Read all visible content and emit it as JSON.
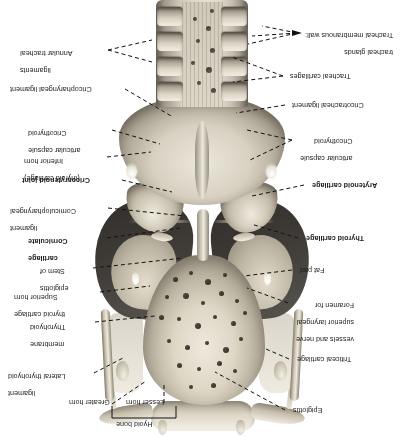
{
  "figure": {
    "orientation": "inverted",
    "view": "posterior view of larynx, hyoid bone and upper trachea",
    "ink_color": "#1a1a1a",
    "background": "#ffffff"
  },
  "labels": {
    "right_column": [
      {
        "id": "tracheal-membranous-wall",
        "lines": [
          "Tracheal membranous wall:",
          "tracheal glands"
        ],
        "bold": false,
        "arrow": true
      },
      {
        "id": "tracheal-cartilages",
        "lines": [
          "Tracheal cartilages"
        ],
        "bold": false,
        "arrow": false
      },
      {
        "id": "cricotracheal-ligament",
        "lines": [
          "Cricotracheal ligament"
        ],
        "bold": false,
        "arrow": false
      },
      {
        "id": "cricothyroid-articular-capsule-right",
        "lines": [
          "Cricothyroid",
          "articular capsule"
        ],
        "bold": false,
        "arrow": false
      },
      {
        "id": "arytenoid-cartilage",
        "lines": [
          "Arytenoid cartilage"
        ],
        "bold": true,
        "arrow": false
      },
      {
        "id": "thyroid-cartilage",
        "lines": [
          "Thyroid cartilage"
        ],
        "bold": true,
        "arrow": false
      },
      {
        "id": "fat-pad",
        "lines": [
          "Fat pad"
        ],
        "bold": false,
        "arrow": false
      },
      {
        "id": "foramen-superior-laryngeal",
        "lines": [
          "Foramen for",
          "superior laryngeal",
          "vessels and nerve"
        ],
        "bold": false,
        "arrow": false
      },
      {
        "id": "triticeal-cartilage",
        "lines": [
          "Triticeal cartilage"
        ],
        "bold": false,
        "arrow": false
      },
      {
        "id": "epiglottis",
        "lines": [
          "Epiglottis"
        ],
        "bold": false,
        "arrow": false
      }
    ],
    "left_column": [
      {
        "id": "annular-tracheal-ligaments",
        "lines": [
          "Annular tracheal",
          "ligaments"
        ],
        "bold": false
      },
      {
        "id": "cricopharyngeal-ligament",
        "lines": [
          "Cricopharyngeal ligament"
        ],
        "bold": false
      },
      {
        "id": "cricothyroid-articular-capsule-left",
        "lines": [
          "Cricothyroid",
          "articular capsule"
        ],
        "bold": false
      },
      {
        "id": "inferior-horn-thyroid",
        "lines": [
          "Inferior horn",
          "(thyroid cartilage)"
        ],
        "bold": false
      },
      {
        "id": "cricoarytenoid-joint",
        "lines": [
          "Cricoarytenoid joint"
        ],
        "bold": true
      },
      {
        "id": "corniculopharyngeal-ligament",
        "lines": [
          "Corniculopharyngeal",
          "ligament"
        ],
        "bold": false
      },
      {
        "id": "corniculate-cartilage",
        "lines": [
          "Corniculate",
          "cartilage"
        ],
        "bold": true
      },
      {
        "id": "stem-of-epiglottis",
        "lines": [
          "Stem of",
          "epiglottis"
        ],
        "bold": false
      },
      {
        "id": "superior-horn-thyroid",
        "lines": [
          "Superior horn",
          "thyroid cartilage"
        ],
        "bold": false
      },
      {
        "id": "thyrohyoid-membrane",
        "lines": [
          "Thyrohyoid",
          "membrane"
        ],
        "bold": false
      },
      {
        "id": "lateral-thyrohyoid-ligament",
        "lines": [
          "Lateral thyrohyoid",
          "ligament"
        ],
        "bold": false
      }
    ],
    "bottom_group": {
      "id": "hyoid-bone-group",
      "bracket_label": "Hyoid bone",
      "members": [
        {
          "id": "greater-horn",
          "lines": [
            "Greater horn"
          ]
        },
        {
          "id": "lesser-horn",
          "lines": [
            "Lesser horn"
          ]
        }
      ]
    }
  },
  "structures": [
    {
      "id": "trachea",
      "name": "Trachea"
    },
    {
      "id": "tracheal-rings",
      "name": "Tracheal cartilage rings",
      "count": 4
    },
    {
      "id": "membranous-wall",
      "name": "Tracheal membranous wall"
    },
    {
      "id": "tracheal-glands",
      "name": "Tracheal glands",
      "count": 9
    },
    {
      "id": "cricoid-lamina",
      "name": "Cricoid cartilage lamina"
    },
    {
      "id": "arytenoid-cartilages",
      "name": "Arytenoid cartilages",
      "count": 2
    },
    {
      "id": "thyroid-laminae",
      "name": "Thyroid cartilage laminae",
      "count": 2
    },
    {
      "id": "fat-pads",
      "name": "Fat pads",
      "count": 2
    },
    {
      "id": "epiglottis-leaf",
      "name": "Epiglottis"
    },
    {
      "id": "epiglottic-foveolae",
      "name": "Epiglottic foveolae (perforations)",
      "count": 26
    },
    {
      "id": "hyoid-bone",
      "name": "Hyoid bone"
    },
    {
      "id": "superior-horns",
      "name": "Superior horns of thyroid cartilage",
      "count": 2
    },
    {
      "id": "triticeal-cartilages",
      "name": "Triticeal cartilages",
      "count": 2
    },
    {
      "id": "foramina",
      "name": "Foramina for superior laryngeal vessels and nerve",
      "count": 2
    }
  ]
}
